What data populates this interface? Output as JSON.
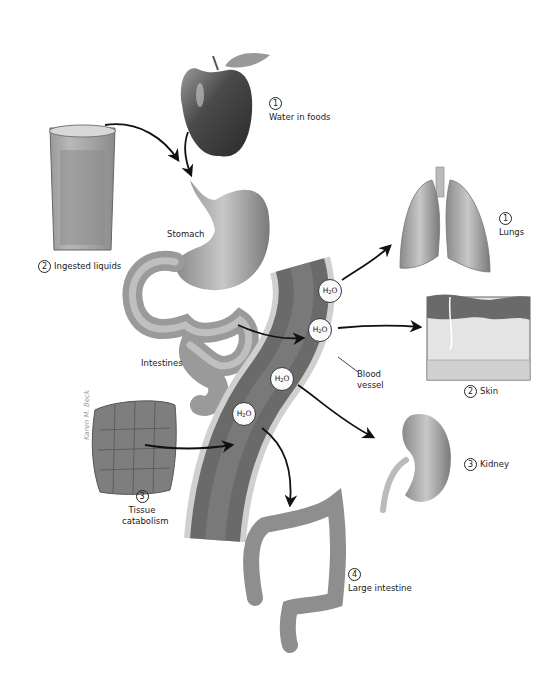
{
  "figure": {
    "intake": [
      {
        "number": "1",
        "label": "Water in foods",
        "icon": "apple-illustration"
      },
      {
        "number": "2",
        "label": "Ingested liquids",
        "icon": "glass-of-water-illustration"
      },
      {
        "number": "3",
        "label_line1": "Tissue",
        "label_line2": "catabolism",
        "icon": "tissue-cells-illustration"
      }
    ],
    "organs": {
      "stomach": "Stomach",
      "intestines": "Intestines",
      "blood_vessel_line1": "Blood",
      "blood_vessel_line2": "vessel"
    },
    "output": [
      {
        "number": "1",
        "label": "Lungs",
        "icon": "lungs-illustration"
      },
      {
        "number": "2",
        "label": "Skin",
        "icon": "skin-cross-section-illustration"
      },
      {
        "number": "3",
        "label": "Kidney",
        "icon": "kidney-illustration"
      },
      {
        "number": "4",
        "label": "Large intestine",
        "icon": "large-intestine-illustration"
      }
    ],
    "molecule": {
      "main": "H",
      "sub": "2",
      "tail": "O"
    },
    "signature": "Karen M. Beck",
    "colors": {
      "ink": "#1a1a1a",
      "organ_gray": "#8c8c8c",
      "vessel_dark": "#555555",
      "background": "#ffffff"
    }
  }
}
